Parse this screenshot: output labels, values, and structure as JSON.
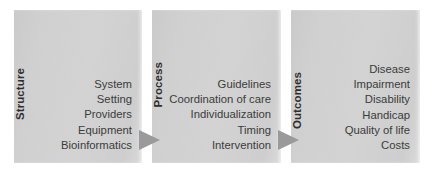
{
  "diagram": {
    "type": "donabedian-quality-framework",
    "background_color": "#ffffff",
    "panel_color": "#cfd0cf",
    "arrow_color": "#9a9a9a",
    "text_color": "#3c3c3c",
    "label_color": "#2e2e2e",
    "panels": [
      {
        "label": "Structure",
        "items": [
          "System",
          "Setting",
          "Providers",
          "Equipment",
          "Bioinformatics"
        ]
      },
      {
        "label": "Process",
        "items": [
          "Guidelines",
          "Coordination of care",
          "Individualization",
          "Timing",
          "Intervention"
        ]
      },
      {
        "label": "Outcomes",
        "items": [
          "Disease",
          "Impairment",
          "Disability",
          "Handicap",
          "Quality of life",
          "Costs"
        ]
      }
    ],
    "arrows": [
      {
        "name": "structure-to-process-arrow",
        "direction": "right"
      },
      {
        "name": "process-to-outcomes-arrow",
        "direction": "right"
      }
    ]
  }
}
